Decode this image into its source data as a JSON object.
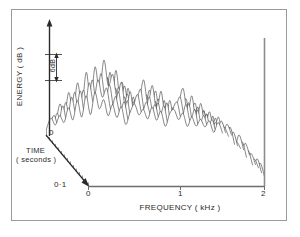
{
  "figure": {
    "background": "#ffffff",
    "frame_color": "#9a9a9a",
    "trace_color": "#3a3a3a",
    "axis_color": "#6e6e6e"
  },
  "axes": {
    "energy": {
      "label": "ENERGY ( dB )",
      "scale_marker": "6dB",
      "zero_tick": "0"
    },
    "time": {
      "label_line1": "TIME",
      "label_line2": "( seconds )",
      "end_tick": "0·1"
    },
    "frequency": {
      "label": "FREQUENCY ( kHz )",
      "ticks": [
        "0",
        "1",
        "2"
      ]
    }
  },
  "chart_data": {
    "type": "line",
    "title": "",
    "xlabel": "FREQUENCY ( kHz )",
    "ylabel": "ENERGY ( dB )",
    "zlabel": "TIME ( seconds )",
    "xlim": [
      0,
      2
    ],
    "zlim": [
      0,
      0.1
    ],
    "ytick_step_db": 6,
    "grid": false,
    "legend": null,
    "projection": "waterfall-3d",
    "x": [
      0,
      0.05,
      0.1,
      0.15,
      0.2,
      0.25,
      0.3,
      0.35,
      0.4,
      0.45,
      0.5,
      0.55,
      0.6,
      0.65,
      0.7,
      0.75,
      0.8,
      0.85,
      0.9,
      0.95,
      1,
      1.05,
      1.1,
      1.15,
      1.2,
      1.25,
      1.3,
      1.35,
      1.4,
      1.45,
      1.5,
      1.55,
      1.6,
      1.65,
      1.7,
      1.75,
      1.8,
      1.85,
      1.9,
      1.95,
      2
    ],
    "series": [
      {
        "name": "t=0.100",
        "values": [
          6,
          15,
          9,
          20,
          11,
          24,
          14,
          27,
          17,
          31,
          20,
          34,
          24,
          30,
          19,
          26,
          14,
          22,
          10,
          18,
          26,
          16,
          23,
          13,
          21,
          11,
          19,
          9,
          17,
          22,
          12,
          19,
          10,
          17,
          8,
          14,
          7,
          12,
          6,
          10,
          4
        ]
      },
      {
        "name": "t=0.093",
        "values": [
          8,
          18,
          11,
          23,
          13,
          27,
          16,
          30,
          19,
          34,
          22,
          37,
          26,
          32,
          21,
          28,
          16,
          24,
          12,
          20,
          29,
          18,
          26,
          15,
          23,
          13,
          21,
          11,
          19,
          25,
          14,
          21,
          11,
          19,
          9,
          16,
          8,
          13,
          6,
          11,
          4
        ]
      },
      {
        "name": "t=0.086",
        "values": [
          7,
          16,
          10,
          21,
          12,
          25,
          15,
          28,
          18,
          32,
          21,
          35,
          24,
          31,
          20,
          27,
          15,
          23,
          11,
          19,
          27,
          17,
          24,
          14,
          22,
          12,
          20,
          10,
          18,
          23,
          13,
          20,
          10,
          18,
          9,
          15,
          7,
          12,
          6,
          10,
          4
        ]
      },
      {
        "name": "t=0.079",
        "values": [
          9,
          20,
          12,
          25,
          15,
          29,
          18,
          33,
          21,
          37,
          24,
          40,
          28,
          34,
          22,
          30,
          17,
          26,
          13,
          21,
          31,
          20,
          28,
          16,
          25,
          14,
          23,
          12,
          20,
          27,
          15,
          23,
          12,
          20,
          10,
          17,
          8,
          14,
          7,
          11,
          5
        ]
      },
      {
        "name": "t=0.071",
        "values": [
          6,
          14,
          9,
          19,
          11,
          23,
          13,
          26,
          16,
          29,
          19,
          32,
          22,
          28,
          18,
          24,
          13,
          21,
          10,
          17,
          25,
          15,
          22,
          12,
          20,
          11,
          18,
          9,
          16,
          21,
          12,
          18,
          9,
          16,
          8,
          14,
          7,
          11,
          5,
          9,
          4
        ]
      },
      {
        "name": "t=0.064",
        "values": [
          8,
          19,
          12,
          24,
          14,
          28,
          17,
          32,
          20,
          36,
          23,
          39,
          27,
          33,
          21,
          29,
          16,
          25,
          12,
          20,
          30,
          19,
          27,
          15,
          24,
          14,
          22,
          11,
          19,
          26,
          14,
          22,
          11,
          19,
          10,
          16,
          8,
          13,
          6,
          11,
          5
        ]
      },
      {
        "name": "t=0.057",
        "values": [
          7,
          17,
          10,
          22,
          13,
          26,
          16,
          29,
          19,
          33,
          22,
          36,
          25,
          31,
          20,
          27,
          15,
          23,
          11,
          19,
          28,
          18,
          25,
          14,
          22,
          13,
          20,
          10,
          18,
          24,
          13,
          20,
          10,
          18,
          9,
          15,
          7,
          12,
          6,
          10,
          4
        ]
      },
      {
        "name": "t=0.050",
        "values": [
          9,
          21,
          13,
          26,
          16,
          31,
          19,
          35,
          22,
          39,
          26,
          42,
          29,
          36,
          23,
          31,
          18,
          27,
          14,
          22,
          33,
          21,
          29,
          17,
          26,
          15,
          24,
          12,
          21,
          28,
          16,
          24,
          12,
          21,
          10,
          18,
          9,
          14,
          7,
          12,
          5
        ]
      },
      {
        "name": "t=0.043",
        "values": [
          6,
          15,
          9,
          20,
          12,
          24,
          14,
          27,
          17,
          30,
          20,
          33,
          23,
          29,
          18,
          25,
          14,
          21,
          10,
          18,
          26,
          16,
          23,
          13,
          21,
          11,
          19,
          9,
          17,
          22,
          12,
          19,
          10,
          17,
          8,
          14,
          7,
          11,
          5,
          9,
          4
        ]
      },
      {
        "name": "t=0.036",
        "values": [
          8,
          18,
          11,
          23,
          14,
          28,
          17,
          31,
          20,
          35,
          23,
          38,
          26,
          32,
          21,
          28,
          16,
          24,
          12,
          20,
          29,
          18,
          26,
          15,
          23,
          13,
          21,
          11,
          19,
          25,
          14,
          21,
          11,
          19,
          9,
          16,
          8,
          13,
          6,
          11,
          4
        ]
      },
      {
        "name": "t=0.029",
        "values": [
          7,
          16,
          10,
          21,
          13,
          25,
          15,
          28,
          18,
          32,
          21,
          34,
          24,
          30,
          19,
          26,
          15,
          22,
          11,
          19,
          27,
          17,
          24,
          14,
          22,
          12,
          20,
          10,
          18,
          23,
          13,
          20,
          10,
          18,
          9,
          15,
          7,
          12,
          6,
          10,
          4
        ]
      },
      {
        "name": "t=0.021",
        "values": [
          9,
          20,
          13,
          25,
          16,
          30,
          19,
          34,
          22,
          38,
          25,
          41,
          28,
          35,
          22,
          30,
          17,
          26,
          13,
          21,
          32,
          20,
          28,
          16,
          25,
          14,
          23,
          12,
          20,
          27,
          15,
          23,
          12,
          20,
          10,
          17,
          8,
          14,
          7,
          11,
          5
        ]
      },
      {
        "name": "t=0.014",
        "values": [
          6,
          14,
          9,
          19,
          11,
          23,
          14,
          26,
          16,
          29,
          19,
          32,
          22,
          28,
          17,
          24,
          13,
          20,
          10,
          17,
          25,
          15,
          22,
          12,
          20,
          11,
          18,
          9,
          16,
          21,
          12,
          18,
          9,
          16,
          8,
          13,
          6,
          11,
          5,
          9,
          3
        ]
      },
      {
        "name": "t=0.007",
        "values": [
          5,
          12,
          8,
          17,
          10,
          20,
          12,
          23,
          14,
          26,
          17,
          28,
          20,
          25,
          15,
          21,
          12,
          18,
          9,
          15,
          22,
          13,
          19,
          11,
          17,
          9,
          16,
          8,
          14,
          18,
          10,
          16,
          8,
          14,
          7,
          12,
          6,
          10,
          4,
          8,
          3
        ]
      },
      {
        "name": "t=0.000",
        "values": [
          3,
          8,
          5,
          11,
          7,
          14,
          8,
          16,
          10,
          18,
          11,
          20,
          14,
          17,
          11,
          15,
          8,
          13,
          6,
          11,
          16,
          10,
          14,
          8,
          13,
          7,
          12,
          6,
          10,
          13,
          8,
          12,
          6,
          10,
          5,
          9,
          4,
          7,
          3,
          6,
          2
        ]
      }
    ]
  }
}
